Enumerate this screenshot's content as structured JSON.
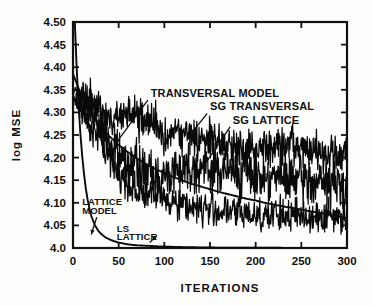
{
  "chart_data": {
    "type": "line",
    "title": "",
    "xlabel": "ITERATIONS",
    "ylabel": "log MSE",
    "xlim": [
      0,
      300
    ],
    "ylim": [
      4.0,
      4.5
    ],
    "grid": false,
    "legend_position": "inline-annotations",
    "xticks": [
      0,
      50,
      100,
      150,
      200,
      250,
      300
    ],
    "xtick_labels": [
      "0",
      "50",
      "100",
      "150",
      "200",
      "250",
      "300"
    ],
    "yticks": [
      4.0,
      4.05,
      4.1,
      4.15,
      4.2,
      4.25,
      4.3,
      4.35,
      4.4,
      4.45,
      4.5
    ],
    "ytick_labels": [
      "4.0",
      "4.05",
      "4.10",
      "4.15",
      "4.20",
      "4.25",
      "4.30",
      "4.35",
      "4.40",
      "4.45",
      "4.50"
    ],
    "annotations": [
      {
        "id": "transversal-model",
        "text": "TRANSVERSAL MODEL",
        "x": 85,
        "y": 4.335
      },
      {
        "id": "sg-transversal",
        "text": "SG TRANSVERSAL",
        "x": 150,
        "y": 4.305
      },
      {
        "id": "sg-lattice",
        "text": "SG LATTICE",
        "x": 175,
        "y": 4.275
      },
      {
        "id": "lattice-model-line1",
        "text": "LATTICE",
        "x": 10,
        "y": 4.095
      },
      {
        "id": "lattice-model-line2",
        "text": "MODEL",
        "x": 10,
        "y": 4.075
      },
      {
        "id": "ls-lattice-line1",
        "text": "LS",
        "x": 48,
        "y": 4.035
      },
      {
        "id": "ls-lattice-line2",
        "text": "LATTICE",
        "x": 48,
        "y": 4.017
      }
    ],
    "series": [
      {
        "name": "LATTICE MODEL",
        "style": "smooth-solid",
        "x": [
          0,
          2,
          4,
          6,
          8,
          10,
          12,
          14,
          16,
          18,
          20,
          24,
          28,
          32,
          36,
          40,
          45,
          50,
          60,
          70,
          80,
          90,
          100,
          120,
          150,
          200,
          250,
          300
        ],
        "values": [
          4.62,
          4.5,
          4.4,
          4.32,
          4.255,
          4.205,
          4.165,
          4.132,
          4.107,
          4.087,
          4.071,
          4.05,
          4.037,
          4.029,
          4.023,
          4.019,
          4.015,
          4.012,
          4.008,
          4.006,
          4.005,
          4.004,
          4.003,
          4.002,
          4.001,
          4.0005,
          4.0003,
          4.0002
        ]
      },
      {
        "name": "TRANSVERSAL MODEL",
        "style": "smooth-solid",
        "x": [
          0,
          10,
          20,
          30,
          40,
          50,
          60,
          70,
          80,
          90,
          100,
          110,
          120,
          130,
          140,
          150,
          160,
          170,
          180,
          190,
          200,
          210,
          220,
          230,
          240,
          250,
          260,
          270,
          280,
          290,
          300
        ],
        "values": [
          4.385,
          4.333,
          4.295,
          4.268,
          4.247,
          4.228,
          4.212,
          4.198,
          4.186,
          4.175,
          4.166,
          4.157,
          4.149,
          4.142,
          4.136,
          4.13,
          4.124,
          4.119,
          4.114,
          4.109,
          4.105,
          4.1,
          4.096,
          4.092,
          4.089,
          4.085,
          4.081,
          4.078,
          4.074,
          4.07,
          4.066
        ]
      },
      {
        "name": "SG TRANSVERSAL",
        "style": "noisy",
        "noise_amplitude": 0.035,
        "x": [
          0,
          10,
          20,
          30,
          40,
          50,
          60,
          70,
          80,
          90,
          100,
          110,
          120,
          130,
          140,
          150,
          160,
          170,
          180,
          190,
          200,
          210,
          220,
          230,
          240,
          250,
          260,
          270,
          280,
          290,
          300
        ],
        "values": [
          4.345,
          4.335,
          4.32,
          4.3,
          4.285,
          4.29,
          4.295,
          4.288,
          4.28,
          4.272,
          4.258,
          4.252,
          4.25,
          4.248,
          4.245,
          4.24,
          4.232,
          4.228,
          4.225,
          4.222,
          4.22,
          4.222,
          4.224,
          4.226,
          4.222,
          4.218,
          4.215,
          4.212,
          4.208,
          4.205,
          4.2
        ]
      },
      {
        "name": "SG LATTICE",
        "style": "noisy",
        "noise_amplitude": 0.042,
        "x": [
          0,
          10,
          20,
          30,
          40,
          50,
          60,
          70,
          80,
          90,
          100,
          110,
          120,
          130,
          140,
          150,
          160,
          170,
          180,
          190,
          200,
          210,
          220,
          230,
          240,
          250,
          260,
          270,
          280,
          290,
          300
        ],
        "values": [
          4.34,
          4.322,
          4.295,
          4.265,
          4.232,
          4.205,
          4.19,
          4.178,
          4.168,
          4.16,
          4.152,
          4.175,
          4.178,
          4.18,
          4.178,
          4.175,
          4.172,
          4.17,
          4.168,
          4.165,
          4.162,
          4.16,
          4.158,
          4.155,
          4.152,
          4.15,
          4.148,
          4.145,
          4.142,
          4.14,
          4.138
        ]
      },
      {
        "name": "LS LATTICE",
        "style": "noisy",
        "noise_amplitude": 0.03,
        "x": [
          0,
          10,
          20,
          30,
          40,
          50,
          60,
          70,
          80,
          90,
          100,
          110,
          120,
          130,
          140,
          150,
          160,
          170,
          180,
          190,
          200,
          210,
          220,
          230,
          240,
          250,
          260,
          270,
          280,
          290,
          300
        ],
        "values": [
          4.33,
          4.3,
          4.27,
          4.235,
          4.2,
          4.165,
          4.14,
          4.128,
          4.12,
          4.115,
          4.11,
          4.105,
          4.098,
          4.092,
          4.088,
          4.085,
          4.082,
          4.08,
          4.078,
          4.076,
          4.075,
          4.074,
          4.073,
          4.072,
          4.072,
          4.071,
          4.071,
          4.07,
          4.07,
          4.07,
          4.07
        ]
      }
    ]
  }
}
